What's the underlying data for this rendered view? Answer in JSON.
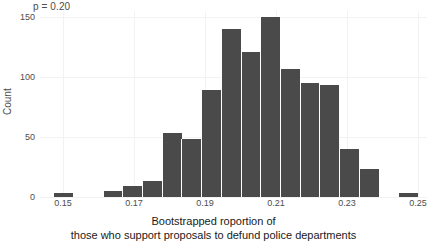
{
  "annotation": {
    "pvalue_label": "p = 0.20"
  },
  "axes": {
    "y_title": "Count",
    "y_ticks": [
      "0",
      "50",
      "100",
      "150"
    ],
    "x_ticks": [
      "0.15",
      "0.17",
      "0.19",
      "0.21",
      "0.23",
      "0.25"
    ],
    "x_title_line1": "Bootstrapped roportion of",
    "x_title_line2": "those who support proposals to defund police departments"
  },
  "colors": {
    "bar_fill": "#4a4a4a",
    "grid": "#f2f2f2",
    "panel_bg": "#ffffff",
    "text": "#4d4d4d"
  },
  "chart_data": {
    "type": "bar",
    "title": "",
    "subtitle": "",
    "xlabel": "Bootstrapped roportion of those who support proposals to defund police departments",
    "ylabel": "Count",
    "annotation": "p = 0.20",
    "xlim": [
      0.1435,
      0.2525
    ],
    "ylim": [
      0,
      155
    ],
    "grid": true,
    "legend": null,
    "bin_width": 0.00556,
    "categories": [
      0.15,
      0.1639,
      0.1694,
      0.175,
      0.1806,
      0.1861,
      0.1917,
      0.1972,
      0.2028,
      0.2083,
      0.2139,
      0.2194,
      0.225,
      0.2306,
      0.2361,
      0.2472
    ],
    "values": [
      3,
      5,
      9,
      13,
      53,
      48,
      89,
      140,
      121,
      150,
      107,
      95,
      93,
      40,
      23,
      3
    ],
    "bins": [
      {
        "center": 0.15,
        "count": 3
      },
      {
        "center": 0.1639,
        "count": 5
      },
      {
        "center": 0.1694,
        "count": 9
      },
      {
        "center": 0.175,
        "count": 13
      },
      {
        "center": 0.1806,
        "count": 53
      },
      {
        "center": 0.1861,
        "count": 48
      },
      {
        "center": 0.1917,
        "count": 89
      },
      {
        "center": 0.1972,
        "count": 140
      },
      {
        "center": 0.2028,
        "count": 121
      },
      {
        "center": 0.2083,
        "count": 150
      },
      {
        "center": 0.2139,
        "count": 107
      },
      {
        "center": 0.2194,
        "count": 95
      },
      {
        "center": 0.225,
        "count": 93
      },
      {
        "center": 0.2306,
        "count": 40
      },
      {
        "center": 0.2361,
        "count": 23
      },
      {
        "center": 0.2472,
        "count": 3
      }
    ]
  }
}
